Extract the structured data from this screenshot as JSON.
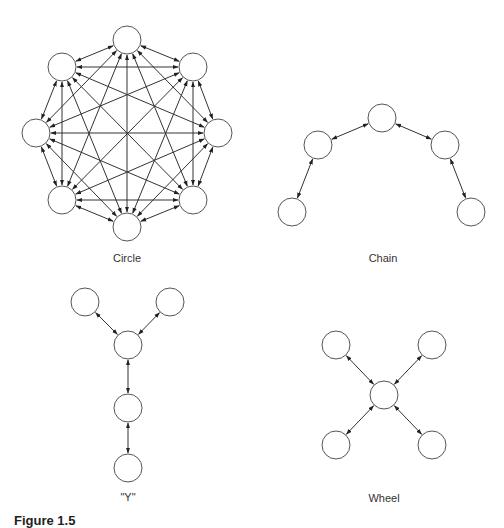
{
  "figure": {
    "caption": "Figure 1.5",
    "line_color": "#333333",
    "node_stroke": "#555555",
    "node_fill": "#ffffff",
    "node_radius": 14
  },
  "networks": [
    {
      "id": "circle",
      "label": "Circle",
      "label_pos": [
        127,
        252
      ],
      "topology": "complete",
      "nodes": [
        [
          127,
          40
        ],
        [
          193,
          67
        ],
        [
          218,
          133
        ],
        [
          193,
          200
        ],
        [
          127,
          227
        ],
        [
          62,
          200
        ],
        [
          36,
          133
        ],
        [
          62,
          67
        ]
      ],
      "edges": "all-pairs"
    },
    {
      "id": "chain",
      "label": "Chain",
      "label_pos": [
        383,
        252
      ],
      "topology": "chain",
      "nodes": [
        [
          292,
          212
        ],
        [
          318,
          145
        ],
        [
          382,
          118
        ],
        [
          445,
          145
        ],
        [
          471,
          212
        ]
      ],
      "edges": [
        [
          0,
          1
        ],
        [
          1,
          2
        ],
        [
          2,
          3
        ],
        [
          3,
          4
        ]
      ]
    },
    {
      "id": "y",
      "label": "\"Y\"",
      "label_pos": [
        128,
        491
      ],
      "topology": "y",
      "nodes": [
        [
          85,
          302
        ],
        [
          170,
          302
        ],
        [
          128,
          345
        ],
        [
          128,
          408
        ],
        [
          128,
          468
        ]
      ],
      "edges": [
        [
          0,
          2
        ],
        [
          1,
          2
        ],
        [
          2,
          3
        ],
        [
          3,
          4
        ]
      ]
    },
    {
      "id": "wheel",
      "label": "Wheel",
      "label_pos": [
        384,
        492
      ],
      "topology": "wheel",
      "nodes": [
        [
          384,
          395
        ],
        [
          336,
          345
        ],
        [
          432,
          345
        ],
        [
          336,
          445
        ],
        [
          432,
          445
        ]
      ],
      "edges": [
        [
          0,
          1
        ],
        [
          0,
          2
        ],
        [
          0,
          3
        ],
        [
          0,
          4
        ]
      ]
    }
  ]
}
